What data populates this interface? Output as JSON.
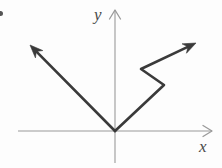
{
  "figure": {
    "width": 222,
    "height": 168,
    "background_color": "#fdfdfd",
    "axis_color": "#9a9a9a",
    "vector_color": "#3a3a3a",
    "label_color": "#4a4a4a"
  },
  "axes": {
    "origin": {
      "x": 115,
      "y": 131
    },
    "x_axis": {
      "label": "x",
      "label_position": {
        "x": 199,
        "y": 138
      },
      "start": {
        "x": 18,
        "y": 131
      },
      "end": {
        "x": 212,
        "y": 131
      },
      "arrowhead": "right"
    },
    "y_axis": {
      "label": "y",
      "label_position": {
        "x": 94,
        "y": 6
      },
      "start": {
        "x": 115,
        "y": 163
      },
      "end": {
        "x": 115,
        "y": 10
      },
      "arrowhead": "up"
    }
  },
  "vectors": [
    {
      "name": "upper-left-vector",
      "description": "Straight arrow from origin pointing up and to the left",
      "points": [
        {
          "x": 115,
          "y": 131
        },
        {
          "x": 30,
          "y": 45
        }
      ],
      "arrowhead_at": "end",
      "stroke_width": 2.6
    },
    {
      "name": "zigzag-right-vector",
      "description": "Zigzag arrow from origin rising to the right with a notch",
      "points": [
        {
          "x": 115,
          "y": 131
        },
        {
          "x": 164,
          "y": 85
        },
        {
          "x": 141,
          "y": 69
        },
        {
          "x": 196,
          "y": 43
        }
      ],
      "arrowhead_at": "end",
      "stroke_width": 2.6
    }
  ],
  "marks": [
    {
      "name": "bullet-mark",
      "description": "Partial list bullet cropped at the left edge",
      "x": -2,
      "y": 11,
      "radius": 2.5,
      "color": "#555555"
    }
  ]
}
